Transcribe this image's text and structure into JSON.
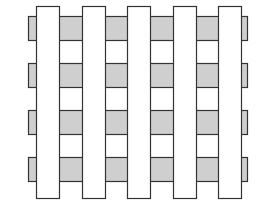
{
  "diagram": {
    "title": "",
    "colors": {
      "background": "#ffffff",
      "band_fill": "#cfcfcf",
      "strip_fill": "#ffffff",
      "stroke": "#333333"
    },
    "bands": {
      "x_left": 28,
      "x_right": 247,
      "height": 24,
      "y_positions": [
        16,
        63,
        110,
        157
      ]
    },
    "strips": {
      "y_top": 6,
      "y_bottom": 198,
      "width": 23,
      "x_positions": [
        36,
        82,
        127,
        173,
        218
      ]
    }
  }
}
